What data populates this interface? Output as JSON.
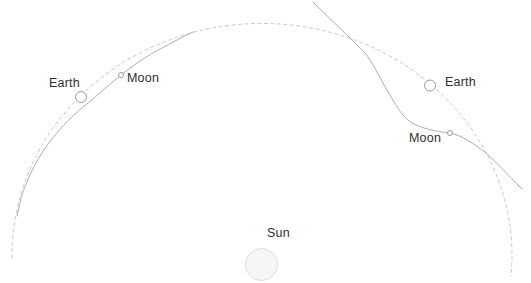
{
  "diagram": {
    "type": "earth-moon-sun-orbit-diagram",
    "labels": {
      "earth_left": "Earth",
      "moon_left": "Moon",
      "earth_right": "Earth",
      "moon_right": "Moon",
      "sun": "Sun"
    },
    "colors": {
      "background": "#ffffff",
      "orbit_dashed": "#c7c7c7",
      "moon_path": "#aeaeae",
      "body_outline": "#9a9a9a",
      "sun_fill": "#f6f6f4",
      "sun_outline": "#dedddb",
      "label_text": "#2f2f2f"
    },
    "curves": {
      "earth_orbit_dashed": "M 12 258 A 250 232 0 1 1 511 276",
      "moon_path_left": "M 17 216 C 20 204 21 196 24 189 C 31 171 38 158 48 144 C 60 128 74 114 88 103 C 100 93 110 84 121 75 C 135 64 147 56 160 49 C 172 43 182 37 193 32",
      "moon_path_right": "M 313 2 C 328 17 342 30 356 44 C 362 50 366 53 370 60 C 378 73 380 78 387 90 C 394 102 398 109 403 115 C 410 123 415 125 424 128 C 434 131 441 132 450 133 C 461 135 473 143 486 153 C 496 162 507 174 522 189"
    },
    "bodies": {
      "earth_left": {
        "cx": 81,
        "cy": 97,
        "r": 5.5
      },
      "moon_left": {
        "cx": 121,
        "cy": 75,
        "r": 2.5
      },
      "earth_right": {
        "cx": 430,
        "cy": 85.5,
        "r": 5.5
      },
      "moon_right": {
        "cx": 450,
        "cy": 133,
        "r": 2.5
      },
      "sun": {
        "cx": 261.5,
        "cy": 264.5,
        "r": 16
      }
    }
  }
}
